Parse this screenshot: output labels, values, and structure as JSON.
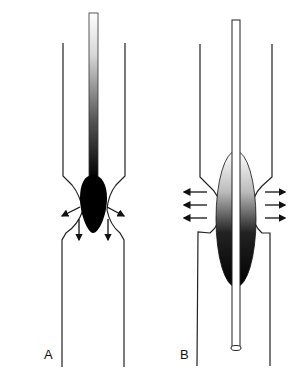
{
  "figure": {
    "panels": [
      {
        "id": "A",
        "label": "A",
        "description": "Probe/bougie with teardrop-shaped tip passing through a narrowing; arrows show radial-downward and downward force"
      },
      {
        "id": "B",
        "label": "B",
        "description": "Balloon catheter inflated within a narrowing; horizontal arrows show radial dilation force"
      }
    ],
    "colors": {
      "line": "#222222",
      "fill_dark": "#000000",
      "fill_light": "#ffffff"
    }
  }
}
